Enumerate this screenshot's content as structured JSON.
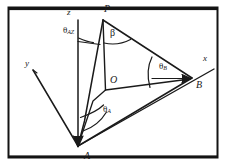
{
  "figure": {
    "name": "spherical-angle-geometry-diagram",
    "background_color": "#ffffff",
    "stroke_color": "#1a1a1a",
    "border_color": "#141414",
    "axes": [
      {
        "id": "z",
        "label": "z",
        "label_x": 67,
        "label_y": 9,
        "from": [
          78,
          146
        ],
        "to": [
          78,
          20
        ]
      },
      {
        "id": "y",
        "label": "y",
        "label_x": 25,
        "label_y": 60,
        "from": [
          78,
          146
        ],
        "to": [
          33,
          70
        ]
      },
      {
        "id": "x",
        "label": "x",
        "label_x": 203,
        "label_y": 56,
        "from": [
          78,
          146
        ],
        "to": [
          214,
          69
        ]
      }
    ],
    "points": [
      {
        "id": "P",
        "label": "P",
        "x": 103,
        "y": 20,
        "label_x": 105,
        "label_y": 6
      },
      {
        "id": "O",
        "label": "O",
        "x": 106,
        "y": 90,
        "label_x": 110,
        "label_y": 76
      },
      {
        "id": "A",
        "label": "A",
        "x": 78,
        "y": 146,
        "label_x": 84,
        "label_y": 152
      },
      {
        "id": "B",
        "label": "B",
        "x": 192,
        "y": 78,
        "label_x": 196,
        "label_y": 80
      }
    ],
    "angles": [
      {
        "id": "theta_AZ",
        "symbol": "θ",
        "subscript": "AZ",
        "label_x": 64,
        "label_y": 28,
        "vertex": "P-z-axis"
      },
      {
        "id": "beta",
        "symbol": "β",
        "subscript": "",
        "label_x": 111,
        "label_y": 31,
        "vertex": "P"
      },
      {
        "id": "theta_B",
        "symbol": "θ",
        "subscript": "B",
        "label_x": 160,
        "label_y": 64,
        "vertex": "B"
      },
      {
        "id": "theta_A",
        "symbol": "θ",
        "subscript": "A",
        "label_x": 104,
        "label_y": 107,
        "vertex": "A"
      }
    ],
    "edges": [
      {
        "id": "P-A",
        "from": [
          103,
          20
        ],
        "to": [
          78,
          146
        ]
      },
      {
        "id": "P-O",
        "from": [
          103,
          20
        ],
        "to": [
          106,
          90
        ]
      },
      {
        "id": "P-B",
        "from": [
          103,
          20
        ],
        "to": [
          192,
          78
        ]
      },
      {
        "id": "O-B",
        "from": [
          106,
          90
        ],
        "to": [
          192,
          78
        ]
      },
      {
        "id": "O-A",
        "from": [
          106,
          90
        ],
        "to": [
          78,
          146
        ]
      },
      {
        "id": "A-B",
        "from": [
          78,
          146
        ],
        "to": [
          192,
          78
        ]
      },
      {
        "id": "z-tick-P",
        "from": [
          78,
          41
        ],
        "to": [
          101,
          44
        ]
      }
    ],
    "border": {
      "x": 8,
      "y": 7,
      "width": 210,
      "height": 151
    }
  }
}
